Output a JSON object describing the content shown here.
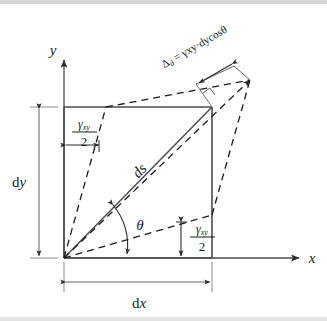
{
  "figure": {
    "type": "engineering-mechanics-diagram",
    "axes": {
      "x_label": "x",
      "y_label": "y",
      "origin_label": ""
    },
    "dimensions": {
      "width_label_prefix": "d",
      "width_label_var": "x",
      "height_label_prefix": "d",
      "height_label_var": "y",
      "width_label": "dx",
      "height_label": "dy"
    },
    "diagonal": {
      "label": "ds",
      "angle_label": "θ"
    },
    "shear_angles": {
      "top_left": {
        "numerator": "γxy",
        "numerator_base": "γ",
        "numerator_sub": "xy",
        "denominator": "2",
        "label": "γxy/2"
      },
      "bottom_right": {
        "numerator": "γxy",
        "numerator_base": "γ",
        "numerator_sub": "xy",
        "denominator": "2",
        "label": "γxy/2"
      }
    },
    "elongation": {
      "symbol": "Δ",
      "symbol_sub": "d",
      "equation": "Δd = γxy·dycosθ",
      "text_lead": "Δ",
      "text_rest": " = γxy·dycosθ"
    },
    "colors": {
      "line": "#4d4d4d",
      "dashed": "#1a1a1a",
      "text": "#1a1a1a",
      "background": "#ffffff",
      "band": "#d8d8d8"
    },
    "geometry": {
      "origin": [
        64,
        258
      ],
      "rect_top_right": [
        212,
        107
      ],
      "deformed_top_right": [
        250,
        80
      ],
      "rect_width_px": 148,
      "rect_height_px": 151
    }
  }
}
